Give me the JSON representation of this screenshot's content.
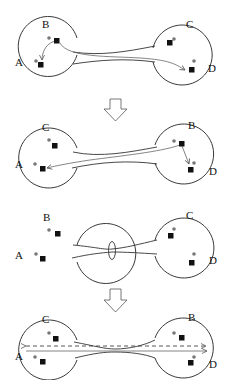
{
  "diagram": {
    "panels": [
      {
        "id": "panel-1",
        "left_labels": [
          "B",
          "A"
        ],
        "right_labels": [
          "C",
          "D"
        ],
        "description": "Two regions connected by a wormhole throat; a geodesic from B travels to A locally and another curves through the throat to D"
      },
      {
        "id": "panel-2",
        "left_labels": [
          "C",
          "A"
        ],
        "right_labels": [
          "B",
          "D"
        ],
        "description": "Reconfigured: path from B goes through throat to A and locally to D"
      },
      {
        "id": "panel-3",
        "left_labels": [
          "B",
          "A"
        ],
        "right_labels": [
          "C",
          "D"
        ],
        "description": "Throat pinched with an ellipse (loop) around the tube"
      },
      {
        "id": "panel-4",
        "left_labels": [
          "C",
          "A"
        ],
        "right_labels": [
          "B",
          "D"
        ],
        "description": "Throat shortened; solid arrow and dashed arrow spanning A to D"
      }
    ],
    "arrows_between_panels": 2,
    "legend": {
      "dot": "grey circle marker",
      "square": "black square marker"
    },
    "colors": {
      "stroke": "#222222",
      "path": "#666666",
      "dot": "#777777",
      "square": "#111111"
    }
  }
}
